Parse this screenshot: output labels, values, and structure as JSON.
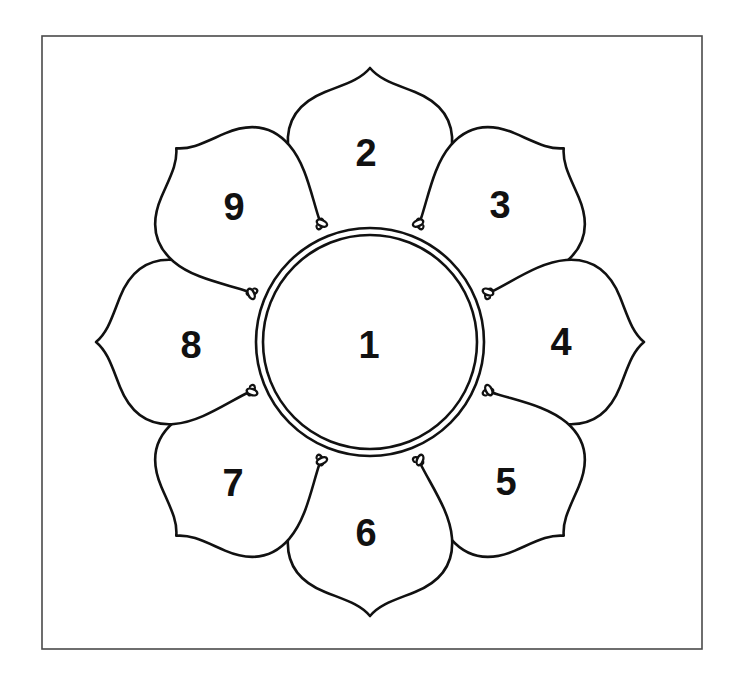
{
  "diagram": {
    "type": "lotus-petal numbered diagram",
    "frame": {
      "x": 42,
      "y": 36,
      "width": 660,
      "height": 613
    },
    "center": {
      "x": 370,
      "y": 342,
      "outer_radius": 114,
      "inner_radius": 107
    },
    "center_label": "1",
    "petals": [
      {
        "label": "2",
        "angle": -90,
        "label_pos": {
          "x": 366,
          "y": 153
        }
      },
      {
        "label": "3",
        "angle": -45,
        "label_pos": {
          "x": 500,
          "y": 205
        }
      },
      {
        "label": "4",
        "angle": 0,
        "label_pos": {
          "x": 561,
          "y": 342
        }
      },
      {
        "label": "5",
        "angle": 45,
        "label_pos": {
          "x": 506,
          "y": 482
        }
      },
      {
        "label": "6",
        "angle": 90,
        "label_pos": {
          "x": 366,
          "y": 533
        }
      },
      {
        "label": "7",
        "angle": 135,
        "label_pos": {
          "x": 233,
          "y": 483
        }
      },
      {
        "label": "8",
        "angle": 180,
        "label_pos": {
          "x": 191,
          "y": 345
        }
      },
      {
        "label": "9",
        "angle": 225,
        "label_pos": {
          "x": 234,
          "y": 207
        }
      }
    ],
    "colors": {
      "line": "#111111",
      "frame": "#4a4a4a",
      "background": "#ffffff"
    }
  }
}
